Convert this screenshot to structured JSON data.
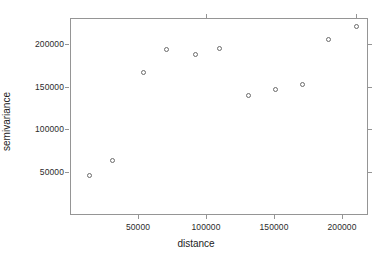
{
  "chart_data": {
    "type": "scatter",
    "title": "",
    "xlabel": "distance",
    "ylabel": "semivariance",
    "xlim": [
      0,
      220000
    ],
    "ylim": [
      10000,
      230000
    ],
    "grid": false,
    "legend": null,
    "xticks": [
      50000,
      100000,
      150000,
      200000
    ],
    "xtick_labels": [
      "50000",
      "100000",
      "150000",
      "200000"
    ],
    "yticks": [
      50000,
      100000,
      150000,
      200000
    ],
    "ytick_labels": [
      "50000",
      "100000",
      "150000",
      "200000"
    ],
    "marker": "open-circle",
    "marker_color": "#6b6b6b",
    "points": [
      {
        "x": 14000,
        "y": 46000
      },
      {
        "x": 31000,
        "y": 63000
      },
      {
        "x": 54000,
        "y": 167000
      },
      {
        "x": 71000,
        "y": 193000
      },
      {
        "x": 92000,
        "y": 188000
      },
      {
        "x": 110000,
        "y": 195000
      },
      {
        "x": 131000,
        "y": 140000
      },
      {
        "x": 151000,
        "y": 147000
      },
      {
        "x": 171000,
        "y": 152000
      },
      {
        "x": 190000,
        "y": 205000
      },
      {
        "x": 211000,
        "y": 221000
      }
    ]
  },
  "axes": {
    "x_title": "distance",
    "y_title": "semivariance"
  },
  "colors": {
    "axis": "#959595",
    "text": "#1c1c1c",
    "marker": "#6b6b6b",
    "background": "#ffffff"
  }
}
